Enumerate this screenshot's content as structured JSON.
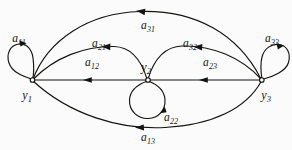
{
  "diagram": {
    "kind": "signal-flow-graph",
    "background_color": "#fbfbfb",
    "line_color": "#15130f",
    "nodes": [
      {
        "id": "y1",
        "base": "y",
        "sub": "1",
        "x": 32,
        "y": 80,
        "label_x": 27,
        "label_y": 94
      },
      {
        "id": "y2",
        "base": "y",
        "sub": "2",
        "x": 148,
        "y": 80,
        "label_x": 146,
        "label_y": 66
      },
      {
        "id": "y3",
        "base": "y",
        "sub": "3",
        "x": 262,
        "y": 80,
        "label_x": 266,
        "label_y": 94
      }
    ],
    "edge_labels": [
      {
        "id": "a11",
        "base": "a",
        "sub": "11",
        "x": 19,
        "y": 37
      },
      {
        "id": "a21",
        "base": "a",
        "sub": "21",
        "x": 99,
        "y": 42
      },
      {
        "id": "a31",
        "base": "a",
        "sub": "31",
        "x": 148,
        "y": 24
      },
      {
        "id": "a12",
        "base": "a",
        "sub": "12",
        "x": 92,
        "y": 61
      },
      {
        "id": "a32",
        "base": "a",
        "sub": "32",
        "x": 190,
        "y": 42
      },
      {
        "id": "a33",
        "base": "a",
        "sub": "33",
        "x": 272,
        "y": 37
      },
      {
        "id": "a23",
        "base": "a",
        "sub": "23",
        "x": 210,
        "y": 61
      },
      {
        "id": "a22",
        "base": "a",
        "sub": "22",
        "x": 171,
        "y": 116
      },
      {
        "id": "a13",
        "base": "a",
        "sub": "13",
        "x": 148,
        "y": 136
      }
    ],
    "edges": [
      {
        "id": "a11",
        "type": "self-loop",
        "from": "y1",
        "to": "y1",
        "direction": "counterclockwise"
      },
      {
        "id": "a22",
        "type": "self-loop",
        "from": "y2",
        "to": "y2",
        "direction": "counterclockwise"
      },
      {
        "id": "a33",
        "type": "self-loop",
        "from": "y3",
        "to": "y3",
        "direction": "clockwise"
      },
      {
        "id": "a21",
        "type": "arc",
        "from": "y1",
        "to": "y2",
        "direction": "rightward"
      },
      {
        "id": "a31",
        "type": "arc",
        "from": "y1",
        "to": "y3",
        "direction": "rightward"
      },
      {
        "id": "a32",
        "type": "arc",
        "from": "y2",
        "to": "y3",
        "direction": "rightward"
      },
      {
        "id": "a12",
        "type": "straight",
        "from": "y2",
        "to": "y1",
        "direction": "leftward"
      },
      {
        "id": "a23",
        "type": "straight",
        "from": "y3",
        "to": "y2",
        "direction": "leftward"
      },
      {
        "id": "a13",
        "type": "arc",
        "from": "y3",
        "to": "y1",
        "direction": "leftward"
      }
    ]
  }
}
